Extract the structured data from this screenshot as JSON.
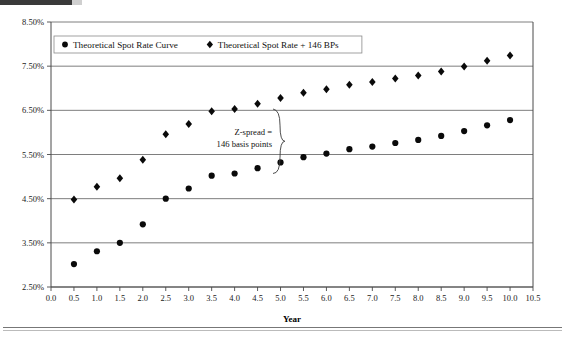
{
  "chart_data": {
    "type": "scatter",
    "title": "",
    "xlabel": "Year",
    "ylabel": "",
    "xlim": [
      0.0,
      10.5
    ],
    "ylim": [
      2.5,
      8.5
    ],
    "ytick_format": "percent",
    "grid": true,
    "legend_position": "top-inside",
    "x": [
      0.5,
      1.0,
      1.5,
      2.0,
      2.5,
      3.0,
      3.5,
      4.0,
      4.5,
      5.0,
      5.5,
      6.0,
      6.5,
      7.0,
      7.5,
      8.0,
      8.5,
      9.0,
      9.5,
      10.0
    ],
    "xticks": [
      "0.0",
      "0.5",
      "1.0",
      "1.5",
      "2.0",
      "2.5",
      "3.0",
      "3.5",
      "4.0",
      "4.5",
      "5.0",
      "5.5",
      "6.0",
      "6.5",
      "7.0",
      "7.5",
      "8.0",
      "8.5",
      "9.0",
      "9.5",
      "10.0",
      "10.5"
    ],
    "xtick_values": [
      0.0,
      0.5,
      1.0,
      1.5,
      2.0,
      2.5,
      3.0,
      3.5,
      4.0,
      4.5,
      5.0,
      5.5,
      6.0,
      6.5,
      7.0,
      7.5,
      8.0,
      8.5,
      9.0,
      9.5,
      10.0,
      10.5
    ],
    "yticks": [
      "2.50%",
      "3.50%",
      "4.50%",
      "5.50%",
      "6.50%",
      "7.50%",
      "8.50%"
    ],
    "ytick_values": [
      2.5,
      3.5,
      4.5,
      5.5,
      6.5,
      7.5,
      8.5
    ],
    "series": [
      {
        "name": "Theoretical Spot Rate Curve",
        "marker": "circle",
        "color": "#0a0a0a",
        "values": [
          3.02,
          3.31,
          3.5,
          3.92,
          4.5,
          4.73,
          5.02,
          5.07,
          5.19,
          5.32,
          5.44,
          5.52,
          5.62,
          5.68,
          5.76,
          5.83,
          5.92,
          6.03,
          6.16,
          6.28
        ]
      },
      {
        "name": "Theoretical Spot Rate + 146 BPs",
        "marker": "diamond",
        "color": "#0a0a0a",
        "values": [
          4.48,
          4.77,
          4.96,
          5.38,
          5.96,
          6.19,
          6.48,
          6.53,
          6.65,
          6.78,
          6.9,
          6.98,
          7.08,
          7.14,
          7.22,
          7.29,
          7.38,
          7.49,
          7.62,
          7.74
        ]
      }
    ],
    "annotation": {
      "line1": "Z-spread =",
      "line2": "146 basis points",
      "brace": "right-curly",
      "spread_bps": 146
    }
  },
  "legend": {
    "entries": [
      {
        "label": "Theoretical Spot Rate Curve",
        "marker": "circle-marker"
      },
      {
        "label": "Theoretical Spot Rate + 146 BPs",
        "marker": "diamond-marker"
      }
    ]
  },
  "axis": {
    "x_title": "Year"
  }
}
